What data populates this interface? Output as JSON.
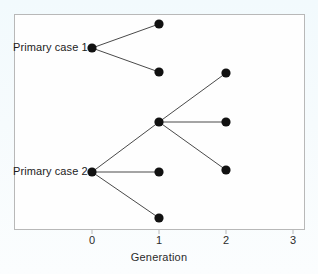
{
  "chart_data": {
    "type": "scatter",
    "title": "",
    "xlabel": "Generation",
    "ylabel": "",
    "xlim": [
      -1.3,
      3.2
    ],
    "ylim": [
      0,
      1
    ],
    "grid": false,
    "legend": null,
    "x_ticks": [
      "0",
      "1",
      "2",
      "3"
    ],
    "x_tick_values": [
      0,
      1,
      2,
      3
    ],
    "annotations": [
      {
        "text": "Primary case 1",
        "x": 0,
        "y": 0.845
      },
      {
        "text": "Primary case 2",
        "x": 0,
        "y": 0.268
      }
    ],
    "nodes": [
      {
        "id": "p1",
        "label": "Primary case 1",
        "generation": 0,
        "x_px": 92,
        "y_px": 48
      },
      {
        "id": "p1a",
        "label": "",
        "generation": 1,
        "x_px": 159,
        "y_px": 24
      },
      {
        "id": "p1b",
        "label": "",
        "generation": 1,
        "x_px": 159,
        "y_px": 72
      },
      {
        "id": "hub",
        "label": "",
        "generation": 1,
        "x_px": 159,
        "y_px": 122
      },
      {
        "id": "hubA",
        "label": "",
        "generation": 2,
        "x_px": 226,
        "y_px": 73
      },
      {
        "id": "hubB",
        "label": "",
        "generation": 2,
        "x_px": 226,
        "y_px": 122
      },
      {
        "id": "hubC",
        "label": "",
        "generation": 2,
        "x_px": 226,
        "y_px": 170
      },
      {
        "id": "p2",
        "label": "Primary case 2",
        "generation": 0,
        "x_px": 92,
        "y_px": 172
      },
      {
        "id": "p2a",
        "label": "",
        "generation": 1,
        "x_px": 159,
        "y_px": 172
      },
      {
        "id": "p2b",
        "label": "",
        "generation": 1,
        "x_px": 159,
        "y_px": 218
      }
    ],
    "edges": [
      {
        "from": "p1",
        "to": "p1a"
      },
      {
        "from": "p1",
        "to": "p1b"
      },
      {
        "from": "p2",
        "to": "hub"
      },
      {
        "from": "p2",
        "to": "p2a"
      },
      {
        "from": "p2",
        "to": "p2b"
      },
      {
        "from": "hub",
        "to": "hubA"
      },
      {
        "from": "hub",
        "to": "hubB"
      },
      {
        "from": "hub",
        "to": "hubC"
      }
    ],
    "style": {
      "node_color": "#111111",
      "node_radius_px": 4.6,
      "edge_color": "#4a4a4a",
      "edge_width_px": 1,
      "axis_color": "#b8b8b8",
      "text_color": "#1c1c1c",
      "background": "#fefefe"
    },
    "axis_px": {
      "left": 14,
      "right": 305,
      "bottom": 230,
      "top": 14,
      "tick_x_px": [
        92,
        159,
        226,
        293
      ]
    }
  }
}
